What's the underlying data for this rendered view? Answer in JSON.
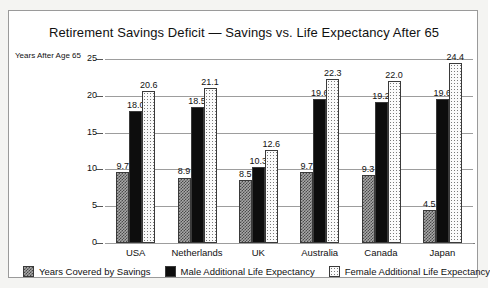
{
  "chart_data": {
    "type": "bar",
    "title": "Retirement Savings Deficit — Savings vs. Life Expectancy After 65",
    "xlabel": "",
    "ylabel": "Years After Age 65",
    "ylim": [
      0,
      25
    ],
    "yticks": [
      0,
      5,
      10,
      15,
      20,
      25
    ],
    "ytick_labels": [
      "0",
      "5",
      "10",
      "15",
      "20",
      "25"
    ],
    "grid": true,
    "legend_position": "bottom",
    "categories": [
      "USA",
      "Netherlands",
      "UK",
      "Australia",
      "Canada",
      "Japan"
    ],
    "series": [
      {
        "name": "Years Covered by Savings",
        "pattern": "checkerboard-gray",
        "values": [
          9.7,
          8.9,
          8.5,
          9.7,
          9.3,
          4.5
        ],
        "labels": [
          "9.7",
          "8.9",
          "8.5",
          "9.7",
          "9.3",
          "4.5"
        ]
      },
      {
        "name": "Male Additional Life Expectancy",
        "pattern": "solid-black",
        "values": [
          18.0,
          18.5,
          10.3,
          19.6,
          19.2,
          19.6
        ],
        "labels": [
          "18.0",
          "18.5",
          "10.3",
          "19.6",
          "19.2",
          "19.6"
        ]
      },
      {
        "name": "Female Additional Life Expectancy",
        "pattern": "sparse-dots",
        "values": [
          20.6,
          21.1,
          12.6,
          22.3,
          22.0,
          24.4
        ],
        "labels": [
          "20.6",
          "21.1",
          "12.6",
          "22.3",
          "22.0",
          "24.4"
        ]
      }
    ]
  },
  "colors": {
    "background": "#ffffff",
    "frame": "#9a9a9a",
    "text": "#111111",
    "grid": "#9d9d9d",
    "savings": "#a8a8a8",
    "male": "#0d0d0d",
    "female": "#fbfbfb"
  }
}
